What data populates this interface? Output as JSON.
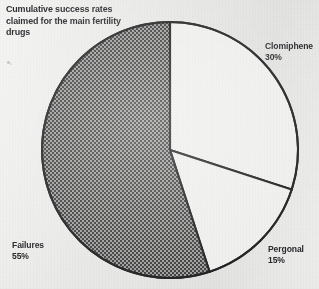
{
  "figure": {
    "caption": "Cumulative success rates\nclaimed for the main fertility\ndrugs",
    "background_color": "#e9e9e7",
    "ink_color": "#26262a"
  },
  "chart_data": {
    "type": "pie",
    "title": "Cumulative success rates claimed for the main fertility drugs",
    "xlabel": "",
    "ylabel": "",
    "grid": false,
    "legend_position": "none",
    "labels_outside": true,
    "start_angle_deg": 0,
    "direction": "clockwise",
    "center": {
      "x": 170,
      "y": 150
    },
    "radius": 128,
    "total_percent": 100,
    "slices": [
      {
        "name": "Clomiphene",
        "label": "Clomiphene\n30%",
        "value": 30,
        "unit": "%",
        "start_deg": 0,
        "end_deg": 108,
        "fill": "#f0f0ee",
        "fill_style": "plain",
        "stroke": "#1b1b1e"
      },
      {
        "name": "Pergonal",
        "label": "Pergonal\n15%",
        "value": 15,
        "unit": "%",
        "start_deg": 108,
        "end_deg": 162,
        "fill": "#f0f0ee",
        "fill_style": "plain",
        "stroke": "#1b1b1e"
      },
      {
        "name": "Failures",
        "label": "Failures\n55%",
        "value": 55,
        "unit": "%",
        "start_deg": 162,
        "end_deg": 360,
        "fill": "#4a4a4a",
        "fill_style": "checkerboard",
        "checker_dark": "#3a3a3a",
        "checker_light": "#9e9e9c",
        "checker_cell_px": 2,
        "stroke": "#1b1b1e"
      }
    ],
    "labels": {
      "clomiphene": {
        "name": "Clomiphene",
        "percent": "30%"
      },
      "pergonal": {
        "name": "Pergonal",
        "percent": "15%"
      },
      "failures": {
        "name": "Failures",
        "percent": "55%"
      }
    }
  }
}
